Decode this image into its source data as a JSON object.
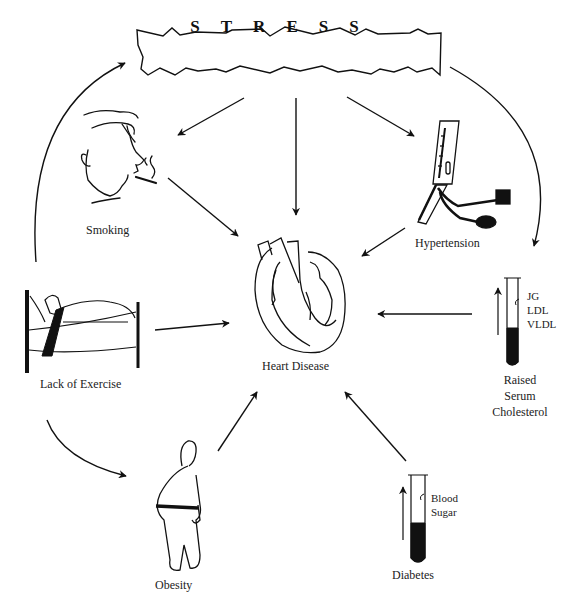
{
  "diagram": {
    "central_node": {
      "id": "heart",
      "label": "Heart Disease",
      "icon": "heart-cross-section-icon"
    },
    "stress": {
      "label": "STRESS",
      "icon": "jagged-banner"
    },
    "nodes": [
      {
        "id": "smoking",
        "label": "Smoking",
        "icon": "smoking-man-icon"
      },
      {
        "id": "hypertension",
        "label": "Hypertension",
        "icon": "sphygmomanometer-icon"
      },
      {
        "id": "lack_of_exercise",
        "label": "Lack of Exercise",
        "icon": "person-in-bed-icon"
      },
      {
        "id": "cholesterol",
        "label_lines": [
          "Raised",
          "Serum",
          "Cholesterol"
        ],
        "icon": "test-tube-icon",
        "tube_labels": [
          "JG",
          "LDL",
          "VLDL"
        ]
      },
      {
        "id": "obesity",
        "label": "Obesity",
        "icon": "obese-person-icon"
      },
      {
        "id": "diabetes",
        "label": "Diabetes",
        "icon": "test-tube-icon",
        "tube_labels": [
          "Blood",
          "Sugar"
        ]
      }
    ],
    "edges": [
      {
        "from": "stress",
        "to": "smoking"
      },
      {
        "from": "stress",
        "to": "heart"
      },
      {
        "from": "stress",
        "to": "hypertension"
      },
      {
        "from": "stress",
        "to": "cholesterol",
        "style": "curved"
      },
      {
        "from": "lack_of_exercise",
        "to": "stress",
        "style": "curved"
      },
      {
        "from": "lack_of_exercise",
        "to": "obesity",
        "style": "curved"
      },
      {
        "from": "smoking",
        "to": "heart"
      },
      {
        "from": "hypertension",
        "to": "heart"
      },
      {
        "from": "lack_of_exercise",
        "to": "heart"
      },
      {
        "from": "cholesterol",
        "to": "heart"
      },
      {
        "from": "obesity",
        "to": "heart"
      },
      {
        "from": "diabetes",
        "to": "heart"
      }
    ]
  },
  "colors": {
    "line": "#111111",
    "background": "#ffffff"
  }
}
